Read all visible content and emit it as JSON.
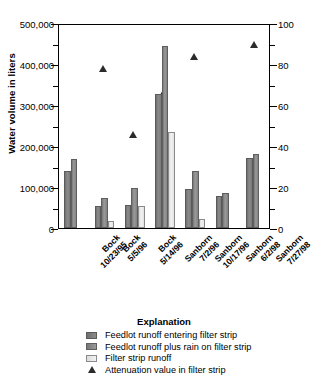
{
  "chart_data": {
    "type": "bar",
    "title": "",
    "categories": [
      "Bock\n10/23/95",
      "Bock\n5/5/96",
      "Bock\n5/14/96",
      "Sanborn\n7/2/96",
      "Sanborn\n10/17/96",
      "Sanborn\n6/2/98",
      "Sanborn\n7/27/98"
    ],
    "category_lines": [
      [
        "Bock",
        "10/23/95"
      ],
      [
        "Bock",
        "5/5/96"
      ],
      [
        "Bock",
        "5/14/96"
      ],
      [
        "Sanborn",
        "7/2/96"
      ],
      [
        "Sanborn",
        "10/17/96"
      ],
      [
        "Sanborn",
        "6/2/98"
      ],
      [
        "Sanborn",
        "7/27/98"
      ]
    ],
    "series": [
      {
        "name": "Feedlot runoff entering filter strip",
        "axis": "left",
        "color": "#808080",
        "values": [
          140000,
          53000,
          56000,
          327000,
          95000,
          78000,
          170000
        ]
      },
      {
        "name": "Feedlot runoff plus rain on filter strip",
        "axis": "left",
        "color": "#909090",
        "values": [
          168000,
          72000,
          97000,
          445000,
          139000,
          86000,
          180000
        ]
      },
      {
        "name": "Filter strip runoff",
        "axis": "left",
        "color": "#e8e8e8",
        "values": [
          null,
          17000,
          53000,
          233000,
          22000,
          null,
          null
        ]
      },
      {
        "name": "Attenuation value in filter strip",
        "axis": "right",
        "marker": "triangle",
        "color": "#2b2b2b",
        "values": [
          null,
          78,
          46,
          67,
          84,
          null,
          90
        ]
      }
    ],
    "xlabel": "",
    "ylabel": "Water volume in liters",
    "y2label": "Attenuation value in filter strip, in percent",
    "ylim": [
      0,
      500000
    ],
    "y2lim": [
      0,
      100
    ],
    "yticks": [
      0,
      100000,
      200000,
      300000,
      400000,
      500000
    ],
    "ytick_labels": [
      "0",
      "100,000",
      "200,000",
      "300,000",
      "400,000",
      "500,000"
    ],
    "yticks_minor": [
      50000,
      150000,
      250000,
      350000,
      450000
    ],
    "y2ticks": [
      0,
      20,
      40,
      60,
      80,
      100
    ],
    "y2tick_labels": [
      "0",
      "20",
      "40",
      "60",
      "80",
      "100"
    ],
    "y2ticks_minor": [
      10,
      30,
      50,
      70,
      90
    ],
    "grid": false,
    "legend_position": "below"
  },
  "legend": {
    "title": "Explanation",
    "entries": [
      {
        "swatch": "series-0-swatch",
        "label": "Feedlot runoff entering filter strip"
      },
      {
        "swatch": "series-1-swatch",
        "label": "Feedlot runoff plus rain on filter strip"
      },
      {
        "swatch": "series-2-swatch",
        "label": "Filter strip runoff"
      },
      {
        "swatch": "attenuation-triangle-marker",
        "label": "Attenuation value in filter strip"
      }
    ]
  }
}
